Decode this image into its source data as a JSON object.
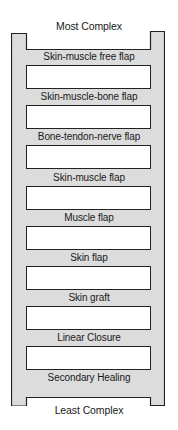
{
  "diagram": {
    "type": "ladder",
    "top_label": "Most Complex",
    "bottom_label": "Least Complex",
    "colors": {
      "rail_fill": "#dcdcdc",
      "outline": "#222222",
      "rung_box_fill": "#ffffff"
    },
    "rungs": [
      {
        "label": "Skin-muscle free flap"
      },
      {
        "label": "Skin-muscle-bone flap"
      },
      {
        "label": "Bone-tendon-nerve flap"
      },
      {
        "label": "Skin-muscle flap"
      },
      {
        "label": "Muscle flap"
      },
      {
        "label": "Skin flap"
      },
      {
        "label": "Skin graft"
      },
      {
        "label": "Linear Closure"
      },
      {
        "label": "Secondary Healing"
      }
    ]
  }
}
